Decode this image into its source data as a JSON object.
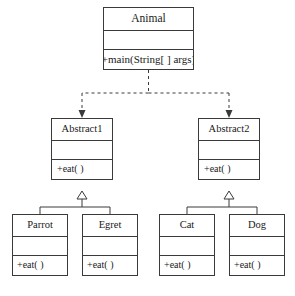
{
  "diagram": {
    "type": "uml-class-diagram",
    "title": "",
    "caption": "",
    "background_color": "#ffffff",
    "line_color": "#3a3a3a",
    "text_color": "#1a1a1a",
    "classes": [
      {
        "id": "animal",
        "name": "Animal",
        "attributes": "",
        "operations": "+main(String[ ] args)"
      },
      {
        "id": "abstract1",
        "name": "Abstract1",
        "attributes": "",
        "operations": "+eat( )"
      },
      {
        "id": "abstract2",
        "name": "Abstract2",
        "attributes": "",
        "operations": "+eat( )"
      },
      {
        "id": "parrot",
        "name": "Parrot",
        "attributes": "",
        "operations": "+eat( )"
      },
      {
        "id": "egret",
        "name": "Egret",
        "attributes": "",
        "operations": "+eat( )"
      },
      {
        "id": "cat",
        "name": "Cat",
        "attributes": "",
        "operations": "+eat( )"
      },
      {
        "id": "dog",
        "name": "Dog",
        "attributes": "",
        "operations": "+eat( )"
      }
    ],
    "relationships": [
      {
        "from": "animal",
        "to": "abstract1",
        "kind": "dependency",
        "style": "dashed",
        "arrow": "open-arrow"
      },
      {
        "from": "animal",
        "to": "abstract2",
        "kind": "dependency",
        "style": "dashed",
        "arrow": "open-arrow"
      },
      {
        "from": "parrot",
        "to": "abstract1",
        "kind": "generalization",
        "style": "solid",
        "arrow": "hollow-triangle"
      },
      {
        "from": "egret",
        "to": "abstract1",
        "kind": "generalization",
        "style": "solid",
        "arrow": "hollow-triangle"
      },
      {
        "from": "cat",
        "to": "abstract2",
        "kind": "generalization",
        "style": "solid",
        "arrow": "hollow-triangle"
      },
      {
        "from": "dog",
        "to": "abstract2",
        "kind": "generalization",
        "style": "solid",
        "arrow": "hollow-triangle"
      }
    ]
  }
}
